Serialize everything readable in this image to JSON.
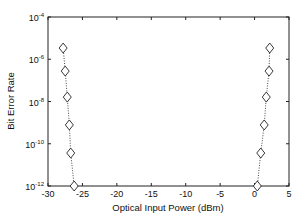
{
  "chart_data": {
    "type": "line",
    "title": "",
    "xlabel": "Optical Input Power (dBm)",
    "ylabel": "Bit Error Rate",
    "xlim": [
      -30,
      5
    ],
    "ylim_log10": [
      -12,
      -4
    ],
    "yscale": "log",
    "grid": false,
    "legend": null,
    "x_ticks": [
      -30,
      -25,
      -20,
      -15,
      -10,
      -5,
      0,
      5
    ],
    "x_tick_labels": [
      "-30",
      "-25",
      "-20",
      "-15",
      "-10",
      "-5",
      "0",
      "5"
    ],
    "y_ticks_log10": [
      -4,
      -6,
      -8,
      -10,
      -12
    ],
    "y_tick_labels": [
      "10^-4",
      "10^-6",
      "10^-8",
      "10^-10",
      "10^-12"
    ],
    "series": [
      {
        "name": "left-curve",
        "marker": "diamond",
        "line_style": "dotted",
        "color": "#000000",
        "x": [
          -27.8,
          -27.5,
          -27.2,
          -26.9,
          -26.7,
          -26.2
        ],
        "y_log10": [
          -5.47,
          -6.56,
          -7.79,
          -9.11,
          -10.44,
          -12.0
        ]
      },
      {
        "name": "right-curve",
        "marker": "diamond",
        "line_style": "dotted",
        "color": "#000000",
        "x": [
          2.2,
          2.1,
          1.7,
          1.4,
          0.9,
          0.4
        ],
        "y_log10": [
          -5.47,
          -6.56,
          -7.79,
          -9.11,
          -10.44,
          -12.0
        ]
      }
    ]
  }
}
